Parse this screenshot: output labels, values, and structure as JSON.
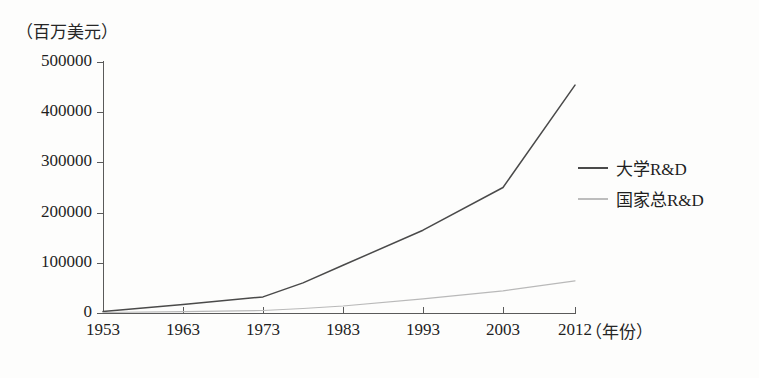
{
  "chart_data": {
    "type": "line",
    "title": "",
    "subtitle": "",
    "xlabel": "（年份）",
    "ylabel": "（百万美元）",
    "x": [
      1953,
      1963,
      1973,
      1978,
      1983,
      1993,
      2003,
      2012
    ],
    "categories": [
      "1953",
      "1963",
      "1973",
      "1983",
      "1993",
      "2003",
      "2012"
    ],
    "xticklabels": [
      "1953",
      "1963",
      "1973",
      "1983",
      "1993",
      "2003",
      "2012"
    ],
    "yticklabels": [
      "0",
      "100000",
      "200000",
      "300000",
      "400000",
      "500000"
    ],
    "ytickvalues": [
      0,
      100000,
      200000,
      300000,
      400000,
      500000
    ],
    "xlim": [
      1953,
      2012
    ],
    "ylim": [
      0,
      500000
    ],
    "grid": false,
    "legend_position": "right",
    "series": [
      {
        "name": "大学R&D",
        "color": "#4a4a4a",
        "x": [
          1953,
          1963,
          1973,
          1978,
          1983,
          1993,
          2003,
          2012
        ],
        "values": [
          3000,
          17000,
          32000,
          60000,
          95000,
          165000,
          250000,
          454000
        ]
      },
      {
        "name": "国家总R&D",
        "color": "#b9b9b9",
        "x": [
          1953,
          1963,
          1973,
          1978,
          1983,
          1993,
          2003,
          2012
        ],
        "values": [
          1000,
          2500,
          5000,
          9000,
          14000,
          28000,
          44000,
          64000
        ]
      }
    ]
  },
  "axes": {
    "y_unit_label": "（百万美元）",
    "x_unit_label": "（年份）",
    "y_ticks": [
      {
        "label": "500000",
        "value": 500000
      },
      {
        "label": "400000",
        "value": 400000
      },
      {
        "label": "300000",
        "value": 300000
      },
      {
        "label": "200000",
        "value": 200000
      },
      {
        "label": "100000",
        "value": 100000
      },
      {
        "label": "0",
        "value": 0
      }
    ],
    "x_ticks": [
      {
        "label": "1953",
        "value": 1953
      },
      {
        "label": "1963",
        "value": 1963
      },
      {
        "label": "1973",
        "value": 1973
      },
      {
        "label": "1983",
        "value": 1983
      },
      {
        "label": "1993",
        "value": 1993
      },
      {
        "label": "2003",
        "value": 2003
      },
      {
        "label": "2012",
        "value": 2012
      }
    ]
  },
  "legend": {
    "entries": [
      {
        "label": "大学R&D",
        "color": "#4a4a4a"
      },
      {
        "label": "国家总R&D",
        "color": "#bdbdbd"
      }
    ]
  },
  "colors": {
    "axis": "#5a5a5a",
    "text": "#1f1f1f",
    "background": "#fdfdfc",
    "series_primary": "#4a4a4a",
    "series_secondary": "#bdbdbd"
  }
}
